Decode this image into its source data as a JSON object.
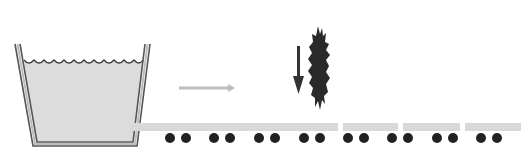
{
  "diagram": {
    "type": "process-illustration",
    "colors": {
      "background": "#ffffff",
      "tank_wall": "#6e6e6e",
      "tank_wall_inner": "#d8d8d8",
      "liquid": "#dcdcdc",
      "flow_arrow": "#bdbdbd",
      "strip": "#d9d9d9",
      "dot": "#222222",
      "blade": "#2a2a2a",
      "down_arrow": "#333333"
    },
    "elements": [
      {
        "id": "tank",
        "label": "liquid bath / tank"
      },
      {
        "id": "flow-arrow",
        "label": "direction of travel (right)"
      },
      {
        "id": "down-arrow",
        "label": "downward motion"
      },
      {
        "id": "cutter",
        "label": "jagged cutting blade"
      },
      {
        "id": "strip",
        "label": "strip segments on rollers"
      }
    ],
    "strip_segments": [
      {
        "x": 130,
        "w": 208
      },
      {
        "x": 343,
        "w": 55
      },
      {
        "x": 403,
        "w": 57
      },
      {
        "x": 465,
        "w": 56
      }
    ],
    "roller_dots_x": [
      170,
      186,
      214,
      230,
      259,
      275,
      304,
      320,
      348,
      364,
      392,
      408,
      437,
      453,
      481,
      497
    ]
  }
}
